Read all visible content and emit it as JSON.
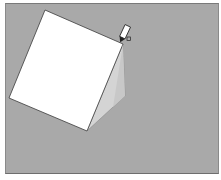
{
  "viewport": {
    "label": "3D modeling viewport",
    "background_color": "#a9a9a9"
  },
  "model": {
    "type": "wedge",
    "front_face_color": "#ffffff",
    "side_face_color": "#d4d4d4",
    "edge_color": "#3a3a3a",
    "vertices": {
      "top_left": [
        44,
        9
      ],
      "top_right": [
        122,
        43
      ],
      "bottom_right": [
        86,
        130
      ],
      "bottom_left": [
        8,
        97
      ],
      "side_bottom": [
        124,
        95
      ]
    }
  },
  "cursor": {
    "icon": "pencil-icon",
    "position": [
      122,
      36
    ]
  }
}
